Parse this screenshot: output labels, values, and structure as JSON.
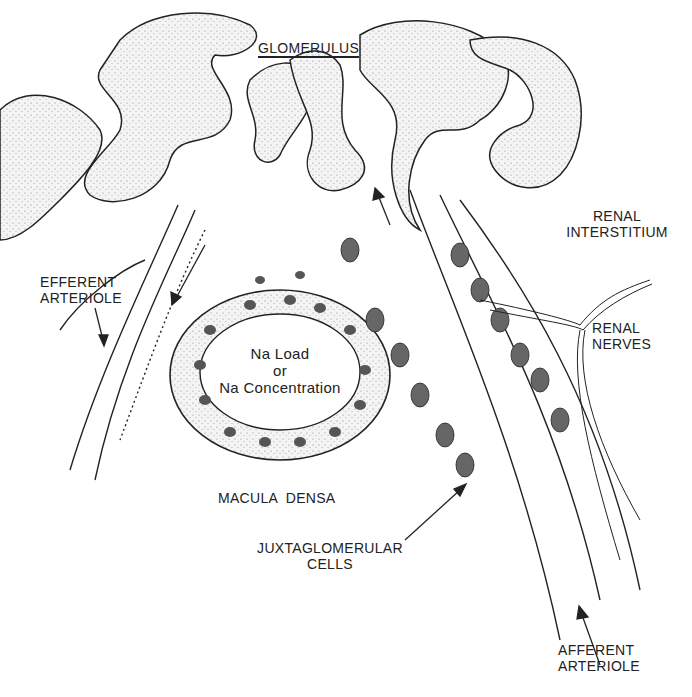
{
  "diagram": {
    "title": "GLOMERULUS",
    "labels": {
      "renal_interstitium_1": "RENAL",
      "renal_interstitium_2": "INTERSTITIUM",
      "efferent_1": "EFFERENT",
      "efferent_2": "ARTERIOLE",
      "renal_nerves_1": "RENAL",
      "renal_nerves_2": "NERVES",
      "na_1": "Na Load",
      "na_2": "or",
      "na_3": "Na Concentration",
      "macula_densa": "MACULA  DENSA",
      "jg_1": "JUXTAGLOMERULAR",
      "jg_2": "CELLS",
      "afferent_1": "AFFERENT",
      "afferent_2": "ARTERIOLE"
    }
  }
}
